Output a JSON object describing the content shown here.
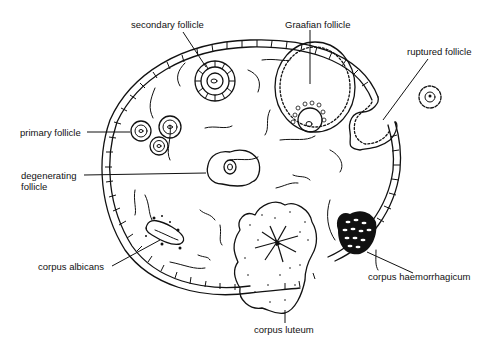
{
  "diagram": {
    "labels": {
      "secondary_follicle": "secondary follicle",
      "graafian_follicle": "Graafian follicle",
      "ruptured_follicle": "ruptured follicle",
      "primary_follicle": "primary follicle",
      "degenerating_follicle_line1": "degenerating",
      "degenerating_follicle_line2": "follicle",
      "corpus_albicans": "corpus albicans",
      "corpus_haemorrhagicum": "corpus haemorrhagicum",
      "corpus_luteum": "corpus luteum"
    },
    "colors": {
      "ink": "#111111",
      "background": "#ffffff"
    }
  }
}
